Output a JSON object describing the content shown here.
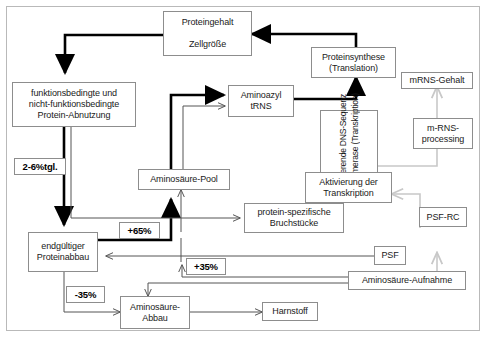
{
  "diagram": {
    "colors": {
      "frame_border": "#b9b9b9",
      "box_border": "#8d8d8d",
      "bold_arrow": "#000000",
      "thin_arrow": "#555555",
      "light_arrow": "#c8c8c8",
      "text": "#1a1a1a"
    },
    "nodes": {
      "proteingehalt": {
        "line1": "Proteingehalt",
        "line2": "Zellgröße"
      },
      "abnutzung": {
        "line1": "funktionsbedingte und",
        "line2": "nicht-funktionsbedingte",
        "line3": "Protein-Abnutzung"
      },
      "proteinabbau": {
        "line1": "endgültiger",
        "line2": "Proteinabbau"
      },
      "aminosaeure_pool": {
        "line1": "Aminosäure-Pool"
      },
      "aminoazyl": {
        "line1": "Aminoazyl",
        "line2": "tRNS"
      },
      "proteinsynthese": {
        "line1": "Proteinsynthese",
        "line2": "(Translation)"
      },
      "mrns_gehalt": {
        "line1": "mRNS-Gehalt"
      },
      "mrns_processing": {
        "line1": "m-RNS-",
        "line2": "processing"
      },
      "transkription_vertical": {
        "col1": "kodierende DNS-Sequenz",
        "col2": "Polymerase (Transkription)"
      },
      "aktivierung": {
        "line1": "Aktivierung der",
        "line2": "Transkription"
      },
      "bruchstuecke": {
        "line1": "protein-spezifische",
        "line2": "Bruchstücke"
      },
      "psf_rc": {
        "line1": "PSF-RC"
      },
      "psf": {
        "line1": "PSF"
      },
      "aufnahme": {
        "line1": "Aminosäure-Aufnahme"
      },
      "abbau": {
        "line1": "Aminosäure-",
        "line2": "Abbau"
      },
      "harnstoff": {
        "line1": "Harnstoff"
      }
    },
    "labels": {
      "daily_turnover": "2-6%tgl.",
      "plus65": "+65%",
      "plus35": "+35%",
      "minus35": "-35%"
    }
  }
}
